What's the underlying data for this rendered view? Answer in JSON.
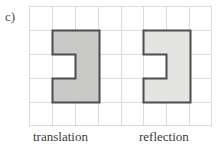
{
  "figure": {
    "part_label": "c)",
    "caption": {
      "left_word": "translation",
      "right_word": "reflection"
    },
    "grid": {
      "columns": 8,
      "rows": 5,
      "cell_size_px": 23,
      "line_color": "#d9d9d7",
      "border_color": "#d2d2d0",
      "background": "#ffffff"
    },
    "shapes": [
      {
        "name": "left-shape",
        "description": "C-shaped hexomino, notch opening to the left",
        "fill": "#c9c9c7",
        "stroke": "#4d4d4b",
        "stroke_width_px": 2,
        "grid_origin_col": 1,
        "grid_origin_row": 1,
        "width_cells": 2,
        "height_cells": 3,
        "notch_cell": {
          "col": 0,
          "row": 1
        },
        "path": "M 0,0 L 46,0 L 46,69 L 0,69 L 0,46 L 23,46 L 23,23 L 0,23 Z"
      },
      {
        "name": "right-shape",
        "description": "C-shaped hexomino, notch opening to the left",
        "fill": "#e4e4e2",
        "stroke": "#4d4d4b",
        "stroke_width_px": 2,
        "grid_origin_col": 5,
        "grid_origin_row": 1,
        "width_cells": 2,
        "height_cells": 3,
        "notch_cell": {
          "col": 0,
          "row": 1
        },
        "path": "M 0,0 L 46,0 L 46,69 L 0,69 L 0,46 L 23,46 L 23,23 L 0,23 Z"
      }
    ]
  }
}
